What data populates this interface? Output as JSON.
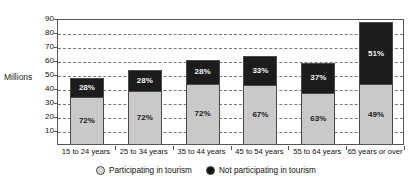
{
  "chart_data": {
    "type": "bar",
    "stacked": true,
    "stacked_mode": "absolute_with_percent_labels",
    "title": "",
    "subtitle": "",
    "xlabel": "",
    "ylabel": "Millions",
    "ylim": [
      0,
      90
    ],
    "yticks": [
      10,
      20,
      30,
      40,
      50,
      60,
      70,
      80,
      90
    ],
    "ytick_labels": [
      "10",
      "20",
      "30",
      "40",
      "50",
      "60",
      "70",
      "80",
      "90"
    ],
    "grid": true,
    "grid_style": "dashed-horizontal",
    "legend_position": "bottom-center",
    "categories": [
      "15 to 24 years",
      "25 to 34 years",
      "35 to 44 years",
      "45 to 54 years",
      "55 to 64 years",
      "65 years or over"
    ],
    "totals": [
      47,
      53,
      60,
      63,
      58,
      87
    ],
    "series": [
      {
        "name": "Participating in tourism",
        "color": "#c9c9c9",
        "percent_values": [
          72,
          72,
          72,
          67,
          63,
          49
        ],
        "percent_labels": [
          "72%",
          "72%",
          "72%",
          "67%",
          "63%",
          "49%"
        ],
        "values": [
          33.8,
          38.2,
          43.2,
          42.2,
          36.5,
          42.6
        ]
      },
      {
        "name": "Not participating in tourism",
        "color": "#1c1c1c",
        "percent_values": [
          28,
          28,
          28,
          33,
          37,
          51
        ],
        "percent_labels": [
          "28%",
          "28%",
          "28%",
          "33%",
          "37%",
          "51%"
        ],
        "values": [
          13.2,
          14.8,
          16.8,
          20.8,
          21.5,
          44.4
        ]
      }
    ],
    "legend": [
      {
        "label": "Participating in tourism",
        "swatch": "light-circle-icon",
        "color": "#d6d6d6"
      },
      {
        "label": "Not participating in tourism",
        "swatch": "dark-circle-icon",
        "color": "#111111"
      }
    ]
  }
}
